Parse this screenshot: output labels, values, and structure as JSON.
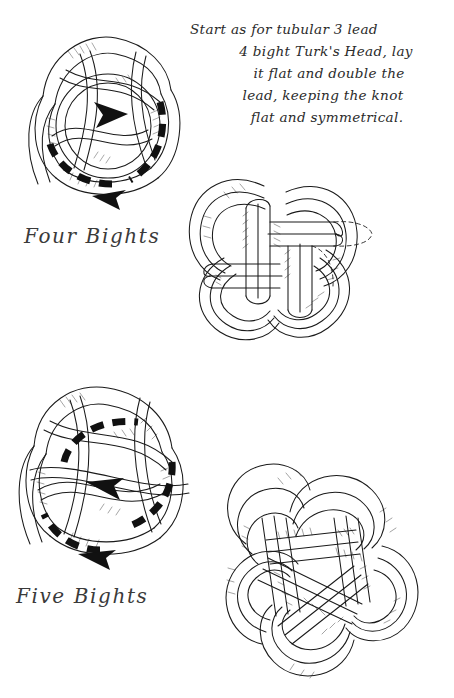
{
  "page": {
    "ink_color": "#1a1a1a",
    "background_color": "#ffffff"
  },
  "instructions": {
    "line1": "Start as for tubular 3 lead",
    "line2": "4 bight Turk's Head, lay",
    "line3": "it flat and double the",
    "line4": "lead, keeping the knot",
    "line5": "flat and symmetrical."
  },
  "figures": [
    {
      "id": "four-bights-start",
      "caption": "Four Bights",
      "description": "Loose 3-lead 4-bight Turk's Head shown with dashed tracing line and arrowheads indicating the doubling direction",
      "bights": 4,
      "leads": 3,
      "has_direction_arrows": true,
      "arrow_count": 2,
      "has_dashed_trace": true
    },
    {
      "id": "four-bights-mat",
      "description": "Same knot laid flat and doubled into a symmetrical mat, with dashed lines showing the hidden strand path at the right",
      "bights": 4,
      "leads": 3,
      "doubled": true,
      "has_direction_arrows": false,
      "has_dashed_trace": true
    },
    {
      "id": "five-bights-start",
      "caption": "Five Bights",
      "description": "Loose 3-lead 5-bight Turk's Head with dashed tracing line and arrowheads indicating the doubling direction",
      "bights": 5,
      "leads": 3,
      "has_direction_arrows": true,
      "arrow_count": 2,
      "has_dashed_trace": true
    },
    {
      "id": "five-bights-mat",
      "description": "Five-bight knot laid flat and doubled into a symmetrical mat",
      "bights": 5,
      "leads": 3,
      "doubled": true,
      "has_direction_arrows": false,
      "has_dashed_trace": false
    }
  ],
  "captions": {
    "four_bights": "Four Bights",
    "five_bights": "Five Bights"
  }
}
